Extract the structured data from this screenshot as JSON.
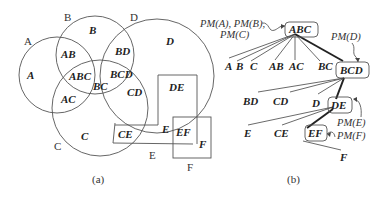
{
  "panel_a": {
    "caption": "(a)",
    "set_labels": {
      "A": "A",
      "B": "B",
      "C": "C",
      "D": "D",
      "E": "E",
      "F": "F"
    },
    "regions": {
      "A": "A",
      "B": "B",
      "C": "C",
      "D": "D",
      "AB": "AB",
      "AC": "AC",
      "BC": "BC",
      "BD": "BD",
      "CD": "CD",
      "ABC": "ABC",
      "BCD": "BCD",
      "DE": "DE",
      "CE": "CE",
      "E": "E",
      "EF": "EF",
      "F": "F"
    }
  },
  "panel_b": {
    "caption": "(b)",
    "annotations": {
      "pm_abc_line1": "PM(A), PM(B),",
      "pm_abc_line2": "PM(C)",
      "pm_bcd": "PM(D)",
      "pm_de": "PM(E)",
      "pm_ef": "PM(F)"
    },
    "nodes": {
      "ABC": "ABC",
      "BCD": "BCD",
      "DE": "DE",
      "EF": "EF"
    },
    "leaves": {
      "level1": [
        "A",
        "B",
        "C",
        "AB",
        "AC",
        "BC"
      ],
      "level2": [
        "BD",
        "CD",
        "D"
      ],
      "level3": [
        "E",
        "CE"
      ],
      "level4": [
        "F"
      ]
    }
  }
}
